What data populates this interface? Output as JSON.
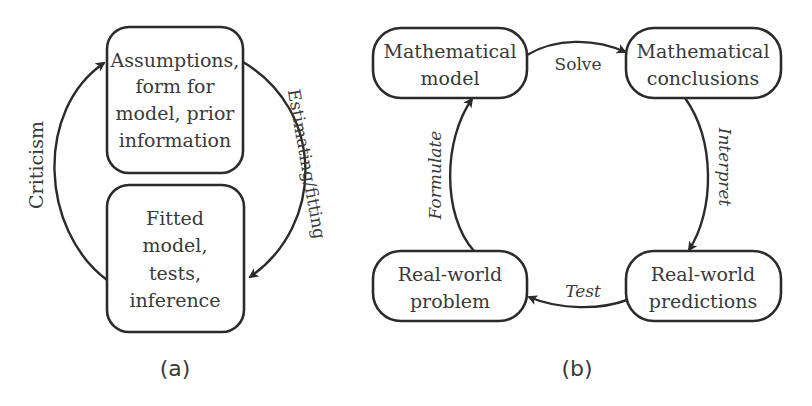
{
  "diagram_a": {
    "caption": "(a)",
    "nodes": [
      {
        "id": "assumptions",
        "lines": [
          "Assumptions,",
          "form for",
          "model, prior",
          "information"
        ]
      },
      {
        "id": "fitted",
        "lines": [
          "Fitted",
          "model,",
          "tests,",
          "inference"
        ]
      }
    ],
    "edges": [
      {
        "from": "assumptions",
        "to": "fitted",
        "label": "Estimating/fitting"
      },
      {
        "from": "fitted",
        "to": "assumptions",
        "label": "Criticism"
      }
    ]
  },
  "diagram_b": {
    "caption": "(b)",
    "nodes": [
      {
        "id": "math_model",
        "lines": [
          "Mathematical",
          "model"
        ]
      },
      {
        "id": "math_conclusions",
        "lines": [
          "Mathematical",
          "conclusions"
        ]
      },
      {
        "id": "real_problem",
        "lines": [
          "Real-world",
          "problem"
        ]
      },
      {
        "id": "real_predictions",
        "lines": [
          "Real-world",
          "predictions"
        ]
      }
    ],
    "edges": [
      {
        "from": "math_model",
        "to": "math_conclusions",
        "label": "Solve"
      },
      {
        "from": "math_conclusions",
        "to": "real_predictions",
        "label": "Interpret"
      },
      {
        "from": "real_predictions",
        "to": "real_problem",
        "label": "Test"
      },
      {
        "from": "real_problem",
        "to": "math_model",
        "label": "Formulate"
      }
    ]
  },
  "colors": {
    "stroke": "#2b2b2b",
    "text": "#3a3a3a",
    "background": "#ffffff"
  }
}
